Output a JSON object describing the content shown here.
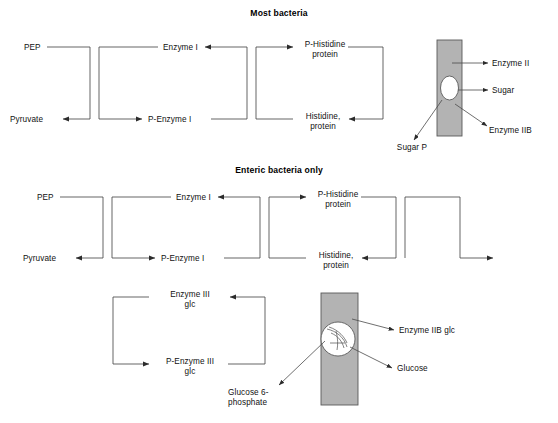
{
  "figure": {
    "panels": [
      {
        "id": "most-bacteria",
        "title": "Most bacteria",
        "labels": {
          "pep": "PEP",
          "pyruvate": "Pyruvate",
          "enzyme_i": "Enzyme I",
          "p_enzyme_i": "P-Enzyme I",
          "p_histidine_protein_line1": "P-Histidine",
          "p_histidine_protein_line2": "protein",
          "histidine_protein_line1": "Histidine,",
          "histidine_protein_line2": "protein",
          "enzyme_ii": "Enzyme II",
          "sugar": "Sugar",
          "enzyme_iib": "Enzyme IIB",
          "sugar_p": "Sugar P"
        }
      },
      {
        "id": "enteric-bacteria-only",
        "title": "Enteric bacteria only",
        "labels": {
          "pep": "PEP",
          "pyruvate": "Pyruvate",
          "enzyme_i": "Enzyme I",
          "p_enzyme_i": "P-Enzyme I",
          "p_histidine_protein_line1": "P-Histidine",
          "p_histidine_protein_line2": "protein",
          "histidine_protein_line1": "Histidine,",
          "histidine_protein_line2": "protein",
          "enzyme_iii_line1": "Enzyme III",
          "enzyme_iii_line2": "glc",
          "p_enzyme_iii_line1": "P-Enzyme III",
          "p_enzyme_iii_line2": "glc",
          "enzyme_iib_glc": "Enzyme IIB glc",
          "glucose": "Glucose",
          "glucose_6_phosphate_line1": "Glucose 6-",
          "glucose_6_phosphate_line2": "phosphate"
        }
      }
    ],
    "colors": {
      "membrane_fill": "#b3b3b3",
      "membrane_stroke": "#555555",
      "line": "#444444",
      "text": "#111111",
      "pore_fill": "#ffffff",
      "background": "#ffffff"
    }
  }
}
